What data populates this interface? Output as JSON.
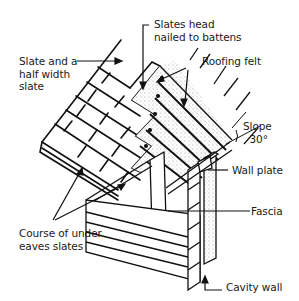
{
  "diagram": {
    "stroke_color": "#111111",
    "background": "#ffffff",
    "labels": {
      "slate_half": "Slate and a\nhalf width\nslate",
      "slates_head": "Slates head\nnailed to battens",
      "roofing_felt": "Roofing felt",
      "slope": "Slope\n  30°",
      "wall_plate": "Wall plate",
      "fascia": "Fascia",
      "course_under_eaves": "Course of under\neaves slates",
      "cavity_wall": "Cavity wall"
    }
  }
}
